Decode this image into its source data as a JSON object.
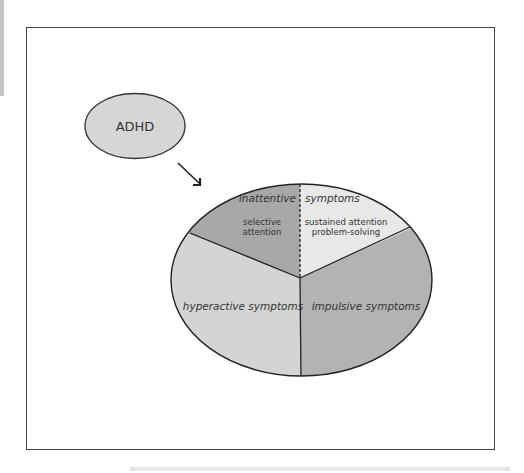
{
  "diagram": {
    "root_node": {
      "label": "ADHD",
      "fill": "#d6d6d6"
    },
    "arrow": {
      "from": "ADHD",
      "to": "symptom-pie"
    },
    "pie": {
      "sectors": [
        {
          "id": "inattentive-selective",
          "header": "inattentive",
          "label_lines": [
            "selective",
            "attention"
          ],
          "fill": "#a8a8a8"
        },
        {
          "id": "inattentive-sustained",
          "header": "symptoms",
          "label_lines": [
            "sustained attention",
            "problem-solving"
          ],
          "fill": "#e8e8e8"
        },
        {
          "id": "impulsive",
          "label": "impulsive symptoms",
          "fill": "#b3b3b3"
        },
        {
          "id": "hyperactive",
          "label": "hyperactive symptoms",
          "fill": "#d4d4d4"
        }
      ]
    }
  }
}
